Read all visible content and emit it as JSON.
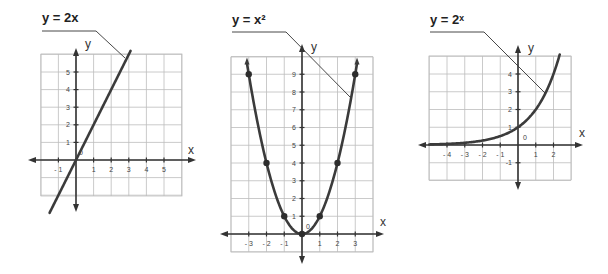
{
  "chart_data": [
    {
      "type": "line",
      "title": "y = 2x",
      "xlabel": "x",
      "ylabel": "y",
      "origin_label": "0",
      "x_ticks": [
        -1,
        1,
        2,
        3,
        4,
        5
      ],
      "y_ticks": [
        1,
        2,
        3,
        4,
        5
      ],
      "xlim": [
        -2,
        6
      ],
      "ylim": [
        -2,
        6
      ],
      "grid": true,
      "points": [],
      "series": [
        {
          "name": "y = 2x",
          "x": [
            -1.5,
            3.2
          ],
          "y": [
            -3,
            6.4
          ]
        }
      ],
      "layout": {
        "ox": 76,
        "oy": 160,
        "cell": 17.6,
        "gx0": 41,
        "gx1": 182,
        "gy0": 54,
        "gy1": 196,
        "axis_x": [
          28,
          196
        ],
        "axis_y": [
          48,
          212
        ],
        "title_pos": [
          42,
          22
        ],
        "leader": [
          [
            42,
            31
          ],
          [
            96,
            31
          ],
          [
            125,
            58
          ]
        ],
        "fn": "2x",
        "xr": [
          -1.5,
          3.1
        ],
        "xlabel_pos": [
          188,
          154
        ],
        "ylabel_pos": [
          85,
          48
        ],
        "origin_pos": [
          79,
          155
        ]
      }
    },
    {
      "type": "line",
      "title": "y = x²",
      "xlabel": "x",
      "ylabel": "y",
      "origin_label": "0",
      "x_ticks": [
        -3,
        -2,
        -1,
        1,
        2,
        3
      ],
      "y_ticks": [
        1,
        2,
        3,
        4,
        5,
        6,
        7,
        8,
        9
      ],
      "xlim": [
        -4,
        4
      ],
      "ylim": [
        -1,
        10
      ],
      "grid": true,
      "points": [
        [
          -3,
          9
        ],
        [
          -2,
          4
        ],
        [
          -1,
          1
        ],
        [
          0,
          0
        ],
        [
          1,
          1
        ],
        [
          2,
          4
        ],
        [
          3,
          9
        ]
      ],
      "series": [
        {
          "name": "y = x²",
          "x": [
            -3,
            -2,
            -1,
            0,
            1,
            2,
            3
          ],
          "y": [
            9,
            4,
            1,
            0,
            1,
            4,
            9
          ]
        }
      ],
      "layout": {
        "ox": 302,
        "oy": 234,
        "cell": 17.75,
        "gx0": 231,
        "gx1": 373,
        "gy0": 57,
        "gy1": 252,
        "axis_x": [
          220,
          384
        ],
        "axis_y": [
          44,
          264
        ],
        "title_pos": [
          232,
          24
        ],
        "leader": [
          [
            232,
            32
          ],
          [
            286,
            32
          ],
          [
            350,
            97
          ]
        ],
        "fn": "x2",
        "xr": [
          -3.1,
          3.1
        ],
        "xlabel_pos": [
          380,
          226
        ],
        "ylabel_pos": [
          311,
          51
        ],
        "origin_pos": [
          306,
          229
        ]
      }
    },
    {
      "type": "line",
      "title": "y = 2ˣ",
      "xlabel": "x",
      "ylabel": "y",
      "origin_label": "0",
      "x_ticks": [
        -4,
        -3,
        -2,
        -1,
        1,
        2
      ],
      "y_ticks": [
        -1,
        1,
        2,
        3,
        4
      ],
      "xlim": [
        -5,
        3
      ],
      "ylim": [
        -2,
        5
      ],
      "grid": true,
      "points": [],
      "series": [
        {
          "name": "y = 2^x",
          "x": [
            -5,
            -4,
            -3,
            -2,
            -1,
            0,
            1,
            2,
            2.3
          ],
          "y": [
            0.03,
            0.06,
            0.13,
            0.25,
            0.5,
            1,
            2,
            4,
            4.9
          ]
        }
      ],
      "layout": {
        "ox": 518,
        "oy": 145,
        "cell": 17.75,
        "gx0": 429,
        "gx1": 571,
        "gy0": 56,
        "gy1": 180,
        "axis_x": [
          418,
          583
        ],
        "axis_y": [
          45,
          190
        ],
        "title_pos": [
          430,
          24
        ],
        "leader": [
          [
            430,
            32
          ],
          [
            484,
            32
          ],
          [
            545,
            93
          ]
        ],
        "fn": "2pow",
        "xr": [
          -5,
          2.35
        ],
        "xlabel_pos": [
          579,
          137
        ],
        "ylabel_pos": [
          528,
          52
        ],
        "origin_pos": [
          523,
          140
        ]
      }
    }
  ]
}
